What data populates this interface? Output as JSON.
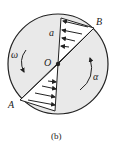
{
  "diagram": {
    "labels": {
      "point_a": "A",
      "point_b": "B",
      "center": "O",
      "omega": "ω",
      "alpha": "α",
      "accel": "a"
    },
    "caption": "(b)",
    "colors": {
      "disk_fill": "#e9e9e9",
      "stroke": "#222222",
      "background": "#ffffff"
    }
  }
}
